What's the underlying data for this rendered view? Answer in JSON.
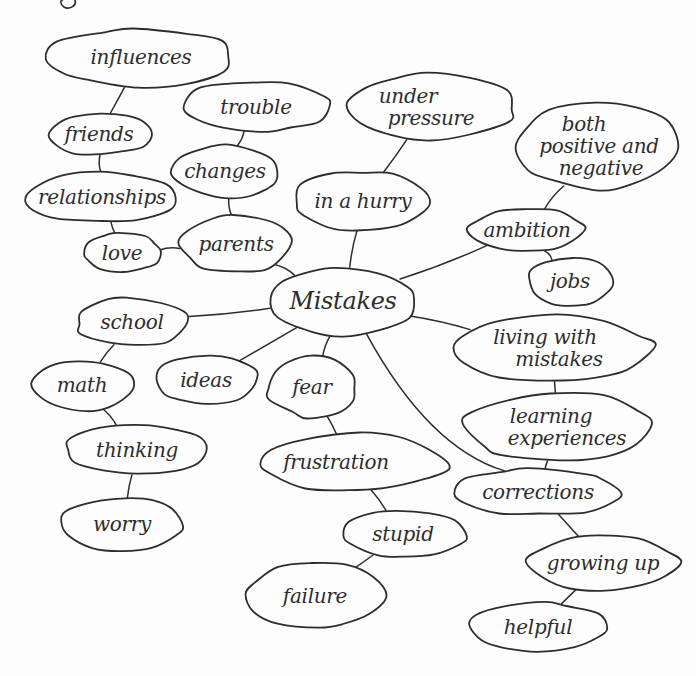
{
  "figure": {
    "background_color": "#fdfdfd",
    "ink_color": "#2d2d2d",
    "center_node_label": "Mistakes"
  },
  "diagram": {
    "type": "mind-map",
    "nodes": [
      {
        "id": "influences",
        "label": "influences",
        "lines": [
          "influences"
        ],
        "line_dx": [
          0
        ],
        "cx": 141,
        "cy": 57,
        "rx": 92,
        "ry": 29,
        "font_size": 20
      },
      {
        "id": "friends",
        "label": "friends",
        "lines": [
          "friends"
        ],
        "line_dx": [
          0
        ],
        "cx": 99,
        "cy": 134,
        "rx": 51,
        "ry": 21,
        "font_size": 20
      },
      {
        "id": "trouble",
        "label": "trouble",
        "lines": [
          "trouble"
        ],
        "line_dx": [
          0
        ],
        "cx": 256,
        "cy": 107,
        "rx": 74,
        "ry": 25,
        "font_size": 20
      },
      {
        "id": "changes",
        "label": "changes",
        "lines": [
          "changes"
        ],
        "line_dx": [
          0
        ],
        "cx": 225,
        "cy": 171,
        "rx": 55,
        "ry": 26,
        "font_size": 20
      },
      {
        "id": "relationships",
        "label": "relationships",
        "lines": [
          "relationships"
        ],
        "line_dx": [
          0
        ],
        "cx": 102,
        "cy": 197,
        "rx": 78,
        "ry": 25,
        "font_size": 20
      },
      {
        "id": "love",
        "label": "love",
        "lines": [
          "love"
        ],
        "line_dx": [
          0
        ],
        "cx": 122,
        "cy": 253,
        "rx": 38,
        "ry": 20,
        "font_size": 20
      },
      {
        "id": "parents",
        "label": "parents",
        "lines": [
          "parents"
        ],
        "line_dx": [
          0
        ],
        "cx": 236,
        "cy": 244,
        "rx": 57,
        "ry": 28,
        "font_size": 20
      },
      {
        "id": "under-pressure",
        "label": "under pressure",
        "lines": [
          "under",
          "pressure"
        ],
        "line_dx": [
          -22,
          1
        ],
        "cx": 430,
        "cy": 107,
        "rx": 82,
        "ry": 34,
        "font_size": 20
      },
      {
        "id": "in-a-hurry",
        "label": "in a hurry",
        "lines": [
          "in a hurry"
        ],
        "line_dx": [
          0
        ],
        "cx": 363,
        "cy": 201,
        "rx": 70,
        "ry": 29,
        "font_size": 20
      },
      {
        "id": "both-positive-and-negative",
        "label": "both positive and negative",
        "lines": [
          "both",
          "positive and",
          "negative"
        ],
        "line_dx": [
          -13,
          2,
          4
        ],
        "cx": 597,
        "cy": 146,
        "rx": 80,
        "ry": 44,
        "font_size": 20
      },
      {
        "id": "ambition",
        "label": "ambition",
        "lines": [
          "ambition"
        ],
        "line_dx": [
          0
        ],
        "cx": 527,
        "cy": 230,
        "rx": 57,
        "ry": 22,
        "font_size": 20
      },
      {
        "id": "jobs",
        "label": "jobs",
        "lines": [
          "jobs"
        ],
        "line_dx": [
          0
        ],
        "cx": 570,
        "cy": 281,
        "rx": 42,
        "ry": 24,
        "font_size": 20
      },
      {
        "id": "mistakes",
        "label": "Mistakes",
        "lines": [
          "Mistakes"
        ],
        "line_dx": [
          0
        ],
        "cx": 343,
        "cy": 301,
        "rx": 75,
        "ry": 34,
        "font_size": 24
      },
      {
        "id": "school",
        "label": "school",
        "lines": [
          "school"
        ],
        "line_dx": [
          0
        ],
        "cx": 132,
        "cy": 322,
        "rx": 55,
        "ry": 24,
        "font_size": 20
      },
      {
        "id": "math",
        "label": "math",
        "lines": [
          "math"
        ],
        "line_dx": [
          0
        ],
        "cx": 82,
        "cy": 385,
        "rx": 50,
        "ry": 25,
        "font_size": 20
      },
      {
        "id": "ideas",
        "label": "ideas",
        "lines": [
          "ideas"
        ],
        "line_dx": [
          0
        ],
        "cx": 206,
        "cy": 380,
        "rx": 52,
        "ry": 25,
        "font_size": 20
      },
      {
        "id": "fear",
        "label": "fear",
        "lines": [
          "fear"
        ],
        "line_dx": [
          0
        ],
        "cx": 312,
        "cy": 387,
        "rx": 45,
        "ry": 30,
        "font_size": 20
      },
      {
        "id": "thinking",
        "label": "thinking",
        "lines": [
          "thinking"
        ],
        "line_dx": [
          0
        ],
        "cx": 137,
        "cy": 450,
        "rx": 71,
        "ry": 25,
        "font_size": 20
      },
      {
        "id": "frustration",
        "label": "frustration",
        "lines": [
          "frustration"
        ],
        "line_dx": [
          -15
        ],
        "cx": 351,
        "cy": 462,
        "rx": 94,
        "ry": 28,
        "font_size": 20
      },
      {
        "id": "worry",
        "label": "worry",
        "lines": [
          "worry"
        ],
        "line_dx": [
          0
        ],
        "cx": 122,
        "cy": 524,
        "rx": 60,
        "ry": 26,
        "font_size": 20
      },
      {
        "id": "stupid",
        "label": "stupid",
        "lines": [
          "stupid"
        ],
        "line_dx": [
          0
        ],
        "cx": 403,
        "cy": 534,
        "rx": 62,
        "ry": 24,
        "font_size": 20
      },
      {
        "id": "failure",
        "label": "failure",
        "lines": [
          "failure"
        ],
        "line_dx": [
          0
        ],
        "cx": 315,
        "cy": 596,
        "rx": 68,
        "ry": 33,
        "font_size": 20
      },
      {
        "id": "living-with-mistakes",
        "label": "living with mistakes",
        "lines": [
          "living with",
          "mistakes"
        ],
        "line_dx": [
          -7,
          7
        ],
        "cx": 552,
        "cy": 348,
        "rx": 100,
        "ry": 32,
        "font_size": 20
      },
      {
        "id": "learning-experiences",
        "label": "learning experiences",
        "lines": [
          "learning",
          "experiences"
        ],
        "line_dx": [
          -7,
          9
        ],
        "cx": 558,
        "cy": 427,
        "rx": 95,
        "ry": 34,
        "font_size": 20
      },
      {
        "id": "corrections",
        "label": "corrections",
        "lines": [
          "corrections"
        ],
        "line_dx": [
          0
        ],
        "cx": 538,
        "cy": 492,
        "rx": 83,
        "ry": 23,
        "font_size": 20
      },
      {
        "id": "growing-up",
        "label": "growing up",
        "lines": [
          "growing up"
        ],
        "line_dx": [
          0
        ],
        "cx": 603,
        "cy": 563,
        "rx": 75,
        "ry": 27,
        "font_size": 20
      },
      {
        "id": "helpful",
        "label": "helpful",
        "lines": [
          "helpful"
        ],
        "line_dx": [
          0
        ],
        "cx": 538,
        "cy": 627,
        "rx": 67,
        "ry": 25,
        "font_size": 20
      }
    ],
    "edges": [
      {
        "from": "influences",
        "to": "friends"
      },
      {
        "from": "friends",
        "to": "relationships"
      },
      {
        "from": "relationships",
        "to": "love"
      },
      {
        "from": "love",
        "to": "parents"
      },
      {
        "from": "trouble",
        "to": "changes"
      },
      {
        "from": "changes",
        "to": "parents"
      },
      {
        "from": "parents",
        "to": "mistakes"
      },
      {
        "from": "under-pressure",
        "to": "in-a-hurry"
      },
      {
        "from": "in-a-hurry",
        "to": "mistakes"
      },
      {
        "from": "both-positive-and-negative",
        "to": "ambition"
      },
      {
        "from": "ambition",
        "to": "mistakes"
      },
      {
        "from": "ambition",
        "to": "jobs"
      },
      {
        "from": "mistakes",
        "to": "school"
      },
      {
        "from": "mistakes",
        "to": "ideas"
      },
      {
        "from": "mistakes",
        "to": "fear"
      },
      {
        "from": "mistakes",
        "to": "living-with-mistakes"
      },
      {
        "from": "mistakes",
        "to": "corrections",
        "via": [
          432,
          425
        ]
      },
      {
        "from": "school",
        "to": "math"
      },
      {
        "from": "math",
        "to": "thinking"
      },
      {
        "from": "thinking",
        "to": "worry"
      },
      {
        "from": "fear",
        "to": "frustration"
      },
      {
        "from": "frustration",
        "to": "stupid"
      },
      {
        "from": "stupid",
        "to": "failure"
      },
      {
        "from": "living-with-mistakes",
        "to": "learning-experiences"
      },
      {
        "from": "learning-experiences",
        "to": "corrections"
      },
      {
        "from": "corrections",
        "to": "growing-up"
      },
      {
        "from": "growing-up",
        "to": "helpful"
      }
    ]
  }
}
